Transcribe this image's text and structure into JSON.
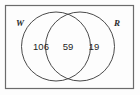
{
  "figure": {
    "type": "venn-diagram",
    "universe_shape": "rectangle",
    "sets": [
      {
        "id": "W",
        "label": "W",
        "position": "left"
      },
      {
        "id": "R",
        "label": "R",
        "position": "right"
      }
    ],
    "regions": [
      {
        "id": "w-only",
        "label": "W only",
        "count": "106"
      },
      {
        "id": "intersection",
        "label": "W and R",
        "count": "59"
      },
      {
        "id": "r-only",
        "label": "R only",
        "count": "19"
      }
    ],
    "colors": {
      "stroke": "#4a4a4a",
      "border": "#6b6b6b",
      "text": "#1f1f1f",
      "background": "#fdfdfd"
    }
  }
}
